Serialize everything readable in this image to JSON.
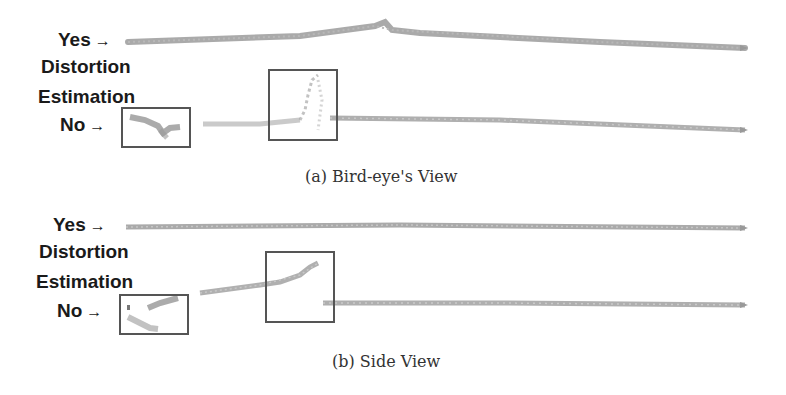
{
  "figure": {
    "panels": [
      {
        "id": "a",
        "caption": "(a) Bird-eye's View",
        "row_labels": {
          "yes": "Yes",
          "title_line1": "Distortion",
          "title_line2": "Estimation",
          "no": "No"
        },
        "arrow": "→"
      },
      {
        "id": "b",
        "caption": "(b) Side View",
        "row_labels": {
          "yes": "Yes",
          "title_line1": "Distortion",
          "title_line2": "Estimation",
          "no": "No"
        },
        "arrow": "→"
      }
    ],
    "colors": {
      "trajectory": "#8a8a8a",
      "box_border": "#555555",
      "label_text": "#1a1a1a",
      "caption_text": "#333333"
    }
  }
}
